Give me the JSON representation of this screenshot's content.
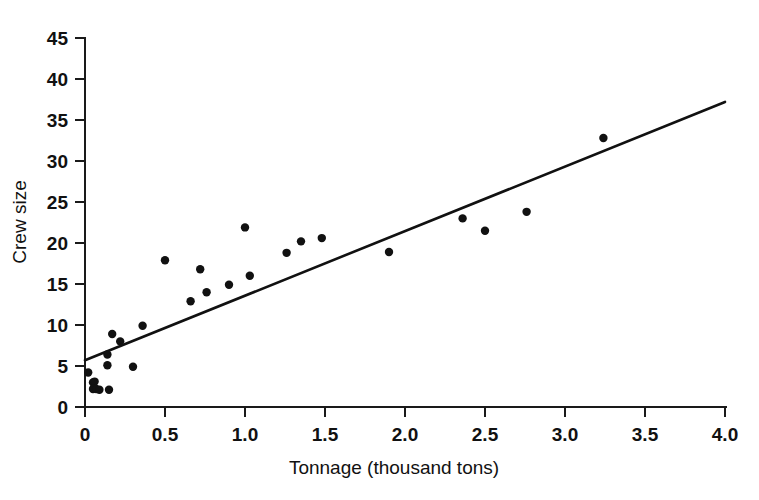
{
  "chart_data": {
    "type": "scatter",
    "title": "",
    "xlabel": "Tonnage (thousand tons)",
    "ylabel": "Crew size",
    "xlim": [
      0,
      4.0
    ],
    "ylim": [
      0,
      45
    ],
    "grid": false,
    "legend": null,
    "xticks": [
      0,
      0.5,
      1.0,
      1.5,
      2.0,
      2.5,
      3.0,
      3.5,
      4.0
    ],
    "xtick_labels": [
      "0",
      "0.5",
      "1.0",
      "1.5",
      "2.0",
      "2.5",
      "3.0",
      "3.5",
      "4.0"
    ],
    "yticks": [
      0,
      5,
      10,
      15,
      20,
      25,
      30,
      35,
      40,
      45
    ],
    "ytick_labels": [
      "0",
      "5",
      "10",
      "15",
      "20",
      "25",
      "30",
      "35",
      "40",
      "45"
    ],
    "marker_color": "#111111",
    "marker_size": 4.2,
    "points": [
      {
        "x": 0.02,
        "y": 4.2
      },
      {
        "x": 0.05,
        "y": 3.0
      },
      {
        "x": 0.06,
        "y": 3.1
      },
      {
        "x": 0.05,
        "y": 2.2
      },
      {
        "x": 0.07,
        "y": 2.2
      },
      {
        "x": 0.09,
        "y": 2.1
      },
      {
        "x": 0.15,
        "y": 2.1
      },
      {
        "x": 0.14,
        "y": 5.1
      },
      {
        "x": 0.14,
        "y": 6.4
      },
      {
        "x": 0.17,
        "y": 8.9
      },
      {
        "x": 0.22,
        "y": 8.0
      },
      {
        "x": 0.3,
        "y": 4.9
      },
      {
        "x": 0.36,
        "y": 9.9
      },
      {
        "x": 0.5,
        "y": 17.9
      },
      {
        "x": 0.66,
        "y": 12.9
      },
      {
        "x": 0.72,
        "y": 16.8
      },
      {
        "x": 0.76,
        "y": 14.0
      },
      {
        "x": 0.9,
        "y": 14.9
      },
      {
        "x": 1.0,
        "y": 21.9
      },
      {
        "x": 1.03,
        "y": 16.0
      },
      {
        "x": 1.26,
        "y": 18.8
      },
      {
        "x": 1.35,
        "y": 20.2
      },
      {
        "x": 1.48,
        "y": 20.6
      },
      {
        "x": 1.9,
        "y": 18.9
      },
      {
        "x": 2.36,
        "y": 23.0
      },
      {
        "x": 2.5,
        "y": 21.5
      },
      {
        "x": 2.76,
        "y": 23.8
      },
      {
        "x": 3.24,
        "y": 32.8
      }
    ],
    "fit_line": {
      "type": "linear-regression",
      "x_start": 0.0,
      "y_start": 5.7,
      "x_end": 4.0,
      "y_end": 37.2,
      "color": "#111111"
    }
  },
  "axes": {
    "y_axis_title": "Crew size",
    "x_axis_title": "Tonnage (thousand tons)"
  }
}
